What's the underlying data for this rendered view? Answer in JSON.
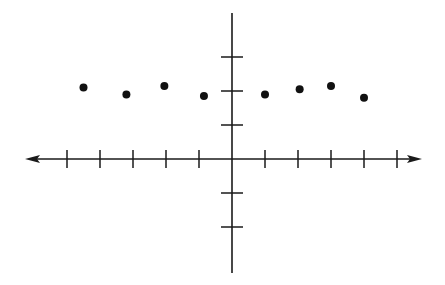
{
  "chart_data": {
    "type": "scatter",
    "title": "",
    "xlabel": "",
    "ylabel": "",
    "xlim": [
      -6,
      6
    ],
    "ylim": [
      -3.5,
      4
    ],
    "x_ticks": [
      -5,
      -4,
      -3,
      -2,
      -1,
      1,
      2,
      3,
      4,
      5
    ],
    "y_ticks": [
      -2,
      -1,
      1,
      2,
      3
    ],
    "tick_labels_shown": false,
    "grid": false,
    "legend": null,
    "points": [
      {
        "x": -4.5,
        "y": 2.1
      },
      {
        "x": -3.2,
        "y": 1.9
      },
      {
        "x": -2.05,
        "y": 2.15
      },
      {
        "x": -0.85,
        "y": 1.85
      },
      {
        "x": 1.0,
        "y": 1.9
      },
      {
        "x": 2.05,
        "y": 2.05
      },
      {
        "x": 3.0,
        "y": 2.15
      },
      {
        "x": 4.0,
        "y": 1.8
      }
    ],
    "colors": {
      "axis": "#1a1a1a",
      "point": "#111111",
      "background": "#ffffff"
    }
  }
}
